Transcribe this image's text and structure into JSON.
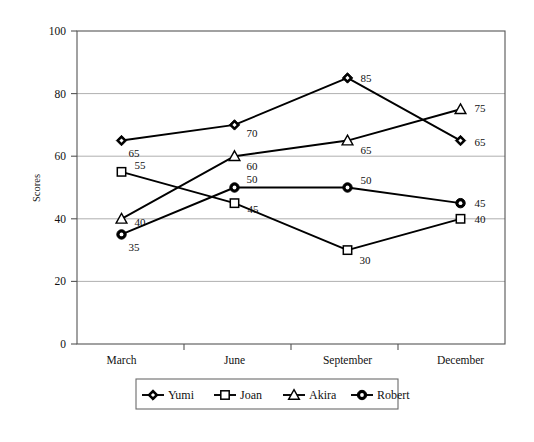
{
  "chart_data": {
    "type": "line",
    "title": "",
    "subtitle": "",
    "xlabel": "",
    "ylabel": "Scores",
    "categories": [
      "March",
      "June",
      "September",
      "December"
    ],
    "ylim": [
      0,
      100
    ],
    "ytick_labels": [
      "0",
      "20",
      "40",
      "60",
      "80",
      "100"
    ],
    "ytick_values": [
      0,
      20,
      40,
      60,
      80,
      100
    ],
    "grid": true,
    "legend_position": "bottom-outside",
    "series": [
      {
        "name": "Yumi",
        "marker": "diamond-filled",
        "values": [
          65,
          70,
          85,
          65
        ],
        "labels": [
          "65",
          "70",
          "85",
          "65"
        ]
      },
      {
        "name": "Joan",
        "marker": "square-hollow",
        "values": [
          55,
          45,
          30,
          40
        ],
        "labels": [
          "55",
          "45",
          "30",
          "40"
        ]
      },
      {
        "name": "Akira",
        "marker": "triangle-hollow",
        "values": [
          40,
          60,
          65,
          75
        ],
        "labels": [
          "40",
          "60",
          "65",
          "75"
        ]
      },
      {
        "name": "Robert",
        "marker": "circle-filled-ring",
        "values": [
          35,
          50,
          50,
          45
        ],
        "labels": [
          "35",
          "50",
          "50",
          "45"
        ]
      }
    ],
    "colors": {
      "line": "#000000",
      "grid": "#9a9a9a",
      "frame": "#555555",
      "text": "#111111",
      "background": "#ffffff"
    }
  },
  "axis": {
    "y_title": "Scores",
    "y_ticks": [
      "100",
      "80",
      "60",
      "40",
      "20",
      "0"
    ],
    "x_ticks": [
      "March",
      "June",
      "September",
      "December"
    ]
  },
  "legend": {
    "entries": [
      {
        "label": "Yumi",
        "marker": "diamond-filled"
      },
      {
        "label": "Joan",
        "marker": "square-hollow"
      },
      {
        "label": "Akira",
        "marker": "triangle-hollow"
      },
      {
        "label": "Robert",
        "marker": "circle-filled-ring"
      }
    ]
  },
  "data_labels": {
    "yumi": [
      "65",
      "70",
      "85",
      "65"
    ],
    "joan": [
      "55",
      "45",
      "30",
      "40"
    ],
    "akira": [
      "40",
      "60",
      "65",
      "75"
    ],
    "robert": [
      "35",
      "50",
      "50",
      "45"
    ]
  }
}
